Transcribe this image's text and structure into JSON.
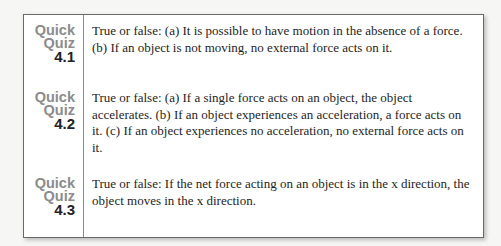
{
  "quizzes": [
    {
      "label_word1": "Quick",
      "label_word2": "Quiz",
      "number": "4.1",
      "text": "True or false: (a) It is possible to have motion in the absence of a force. (b) If an object is not moving, no external force acts on it."
    },
    {
      "label_word1": "Quick",
      "label_word2": "Quiz",
      "number": "4.2",
      "text": "True or false: (a) If a single force acts on an object, the object accelerates. (b) If an object experiences an acceleration, a force acts on it. (c) If an object experiences no acceleration, no external force acts on it."
    },
    {
      "label_word1": "Quick",
      "label_word2": "Quiz",
      "number": "4.3",
      "text": "True or false: If the net force acting on an object is in the x direction, the object moves in the x direction."
    }
  ],
  "colors": {
    "label_gray": "#8c8c8c",
    "number_dark": "#222222",
    "border": "#6a6a6a"
  }
}
